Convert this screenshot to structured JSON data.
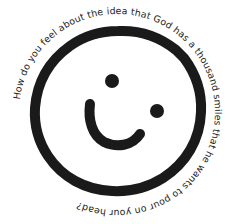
{
  "caption": {
    "text": "How do you feel about the idea that God has a thousand smiles that he wants to pour on your head?"
  },
  "face": {
    "stroke_color": "#1a1a1a",
    "background": "#ffffff"
  }
}
